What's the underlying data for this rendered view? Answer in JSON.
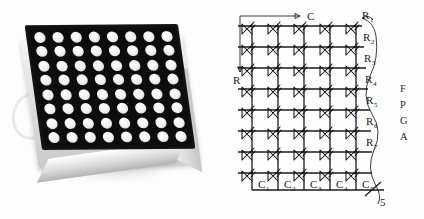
{
  "figure": {
    "caption": "",
    "panels": [
      {
        "name": "photo",
        "description": "8x8 LED dot matrix display module"
      },
      {
        "name": "schematic",
        "description": "LED matrix wiring to FPGA"
      }
    ]
  },
  "photo": {
    "alt": "LED dot matrix module",
    "rows": 8,
    "cols": 8,
    "face_color": "#0d0d0d",
    "dot_color": "#f0f0f0",
    "body_color": "#e3e3e3"
  },
  "schematic": {
    "axis": {
      "column_arrow_label": "C",
      "row_arrow_label": "R"
    },
    "grid": {
      "rows": 8,
      "cols": 5
    },
    "row_labels": [
      "R1",
      "R2",
      "R3",
      "R4",
      "R5",
      "R6",
      "R7"
    ],
    "row_label_base": [
      "R",
      "R",
      "R",
      "R",
      "R",
      "R",
      "R"
    ],
    "row_label_subs": [
      "1",
      "2",
      "3",
      "4",
      "5",
      "6",
      "7"
    ],
    "col_label_base": [
      "C",
      "C",
      "C",
      "C",
      "C"
    ],
    "col_label_subs": [
      "1",
      "2",
      "3",
      "4",
      "5"
    ],
    "col_labels": [
      "C1",
      "C2",
      "C3",
      "C4",
      "C5"
    ],
    "bus_width_label": "5",
    "target_device": "FPGA",
    "target_device_letters": [
      "F",
      "P",
      "G",
      "A"
    ],
    "line_color": "#1a1a1a",
    "background": "#ffffff"
  }
}
